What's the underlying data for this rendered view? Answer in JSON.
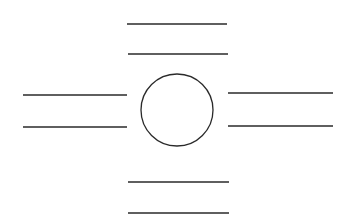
{
  "canvas": {
    "width": 351,
    "height": 221,
    "background": "#ffffff",
    "stroke_color": "#2a2a2a"
  },
  "diagram": {
    "circle": {
      "cx": 177,
      "cy": 110,
      "r": 36
    },
    "line_groups": [
      {
        "position": "top",
        "lines": [
          {
            "x1": 127,
            "y1": 24,
            "x2": 227,
            "y2": 24
          },
          {
            "x1": 128,
            "y1": 54,
            "x2": 228,
            "y2": 54
          }
        ]
      },
      {
        "position": "left",
        "lines": [
          {
            "x1": 23,
            "y1": 95,
            "x2": 127,
            "y2": 95
          },
          {
            "x1": 23,
            "y1": 127,
            "x2": 127,
            "y2": 127
          }
        ]
      },
      {
        "position": "right",
        "lines": [
          {
            "x1": 228,
            "y1": 93,
            "x2": 333,
            "y2": 93
          },
          {
            "x1": 228,
            "y1": 126,
            "x2": 333,
            "y2": 126
          }
        ]
      },
      {
        "position": "bottom",
        "lines": [
          {
            "x1": 128,
            "y1": 182,
            "x2": 229,
            "y2": 182
          },
          {
            "x1": 128,
            "y1": 213,
            "x2": 229,
            "y2": 213
          }
        ]
      }
    ]
  }
}
